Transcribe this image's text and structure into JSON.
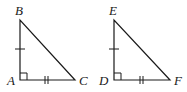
{
  "diagram": {
    "type": "congruent-right-triangles",
    "stroke_color": "#1a1a1a",
    "background": "#ffffff",
    "triangles": [
      {
        "name": "ABC",
        "right_angle_at": "A",
        "vertices": {
          "A": {
            "label": "A",
            "x": 20,
            "y": 80
          },
          "B": {
            "label": "B",
            "x": 20,
            "y": 20
          },
          "C": {
            "label": "C",
            "x": 75,
            "y": 80
          }
        },
        "marks": {
          "AB": "single-tick",
          "AC": "double-tick"
        }
      },
      {
        "name": "DEF",
        "right_angle_at": "D",
        "vertices": {
          "D": {
            "label": "D",
            "x": 114,
            "y": 80
          },
          "E": {
            "label": "E",
            "x": 114,
            "y": 20
          },
          "F": {
            "label": "F",
            "x": 170,
            "y": 80
          }
        },
        "marks": {
          "DE": "single-tick",
          "DF": "double-tick"
        }
      }
    ]
  }
}
